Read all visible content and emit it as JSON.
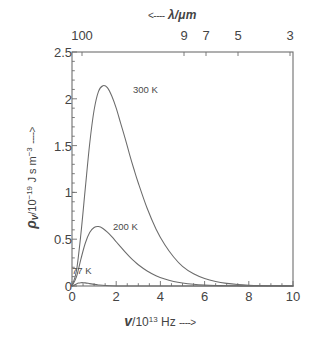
{
  "chart_data": {
    "type": "line",
    "title": "",
    "subtitle": "",
    "xlabel": "v/10^13 Hz ---->",
    "ylabel": "p_v/10^-19 J s m^-3 ---->",
    "secondary_xlabel": "<---- lambda/um",
    "xlim": [
      0,
      10
    ],
    "ylim": [
      0,
      2.5
    ],
    "grid": false,
    "legend_position": "inline-annotations",
    "x_ticks": [
      "0",
      "2",
      "4",
      "6",
      "8",
      "10"
    ],
    "x_tick_values": [
      0,
      2,
      4,
      6,
      8,
      10
    ],
    "y_ticks": [
      "0",
      "0.5",
      "1",
      "1.5",
      "2",
      "2.5"
    ],
    "y_tick_values": [
      0,
      0.5,
      1,
      1.5,
      2,
      2.5
    ],
    "secondary_x_ticks": [
      "100",
      "9",
      "7",
      "5",
      "3"
    ],
    "secondary_x_tick_values": [
      0.3,
      3.333,
      4.286,
      6.0,
      10.0
    ],
    "series": [
      {
        "name": "300 K",
        "temperature_K": 300,
        "color": "#6b6b6b",
        "peak": {
          "x": 1.76,
          "y": 2.14
        },
        "x": [
          0,
          0.2,
          0.4,
          0.6,
          0.8,
          1.0,
          1.2,
          1.4,
          1.6,
          1.8,
          2.0,
          2.2,
          2.4,
          2.6,
          2.8,
          3.0,
          3.4,
          3.8,
          4.2,
          4.6,
          5.0,
          5.5,
          6.0,
          6.5,
          7.0,
          7.5,
          8.0,
          8.5,
          9.0,
          9.5,
          10.0
        ],
        "y": [
          0,
          0.16,
          0.55,
          1.04,
          1.52,
          1.88,
          2.08,
          2.14,
          2.12,
          2.03,
          1.9,
          1.74,
          1.58,
          1.41,
          1.25,
          1.1,
          0.83,
          0.61,
          0.44,
          0.31,
          0.21,
          0.13,
          0.08,
          0.048,
          0.028,
          0.016,
          0.009,
          0.005,
          0.003,
          0.0015,
          0.0008
        ]
      },
      {
        "name": "200 K",
        "temperature_K": 200,
        "color": "#6b6b6b",
        "peak": {
          "x": 1.17,
          "y": 0.635
        },
        "x": [
          0,
          0.2,
          0.4,
          0.6,
          0.8,
          1.0,
          1.2,
          1.4,
          1.6,
          1.8,
          2.0,
          2.2,
          2.4,
          2.6,
          2.8,
          3.0,
          3.4,
          3.8,
          4.2,
          4.6,
          5.0,
          5.5,
          6.0,
          6.5,
          7.0,
          7.5,
          8.0,
          9.0,
          10.0
        ],
        "y": [
          0,
          0.097,
          0.285,
          0.457,
          0.572,
          0.625,
          0.635,
          0.615,
          0.576,
          0.527,
          0.473,
          0.418,
          0.364,
          0.314,
          0.268,
          0.227,
          0.16,
          0.11,
          0.074,
          0.049,
          0.032,
          0.018,
          0.01,
          0.0056,
          0.003,
          0.0016,
          0.0009,
          0.0002,
          6e-05
        ]
      },
      {
        "name": "77 K",
        "temperature_K": 77,
        "color": "#6b6b6b",
        "peak": {
          "x": 0.45,
          "y": 0.036
        },
        "x": [
          0,
          0.1,
          0.2,
          0.3,
          0.4,
          0.5,
          0.6,
          0.8,
          1.0,
          1.2,
          1.5,
          2.0,
          2.5,
          3.0,
          4.0,
          5.0,
          6.0,
          8.0,
          10.0
        ],
        "y": [
          0,
          0.0085,
          0.0215,
          0.031,
          0.0355,
          0.0358,
          0.0335,
          0.0255,
          0.0172,
          0.0108,
          0.0047,
          0.001,
          0.0002,
          4e-05,
          1e-06,
          0,
          0,
          0,
          0
        ]
      }
    ],
    "annotations": [
      {
        "text": "300 K",
        "x": 2.4,
        "y": 2.05
      },
      {
        "text": "200 K",
        "x": 1.85,
        "y": 0.57
      },
      {
        "text": "77 K",
        "x": 0.55,
        "y": 0.17
      }
    ]
  },
  "axes": {
    "top": {
      "title_arrow": "<----",
      "title_symbol": "λ",
      "title_units": "/μm",
      "ticks": [
        {
          "label": "100",
          "pos_px": 82
        },
        {
          "label": "9",
          "pos_px": 184
        },
        {
          "label": "7",
          "pos_px": 206
        },
        {
          "label": "5",
          "pos_px": 238
        },
        {
          "label": "3",
          "pos_px": 290
        }
      ]
    },
    "left": {
      "title_symbol": "ρ",
      "title_subscript": "v",
      "title_mantissa": "/10",
      "title_exponent": "−19",
      "title_units": "J s m",
      "title_units_exponent": "−3",
      "title_arrow": "---->",
      "ticks": [
        {
          "label": "2.5",
          "value": 2.5
        },
        {
          "label": "2",
          "value": 2
        },
        {
          "label": "1.5",
          "value": 1.5
        },
        {
          "label": "1",
          "value": 1
        },
        {
          "label": "0.5",
          "value": 0.5
        },
        {
          "label": "0",
          "value": 0
        }
      ]
    },
    "bottom": {
      "title_symbol": "v",
      "title_mantissa": "/10",
      "title_exponent": "13",
      "title_units": "Hz",
      "title_arrow": "---->",
      "ticks": [
        {
          "label": "0",
          "value": 0
        },
        {
          "label": "2",
          "value": 2
        },
        {
          "label": "4",
          "value": 4
        },
        {
          "label": "6",
          "value": 6
        },
        {
          "label": "8",
          "value": 8
        },
        {
          "label": "10",
          "value": 10
        }
      ]
    }
  },
  "style": {
    "background": "#ffffff",
    "frame_color": "#6e6e6e",
    "curve_color": "#6b6b6b",
    "text_color": "#444444"
  }
}
